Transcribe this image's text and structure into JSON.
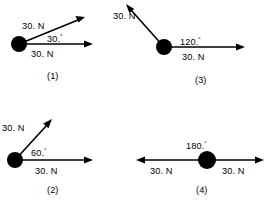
{
  "figure": {
    "background_color": "#ffffff",
    "ink_color": "#000000",
    "degree_symbol": "°",
    "panels": [
      {
        "id": "panel-1",
        "caption": "(1)",
        "angle_label": "30.",
        "angle_value": 30,
        "force_a_label": "30. N",
        "force_b_label": "30. N",
        "vectors": [
          {
            "name": "horizontal-force",
            "magnitude": "30. N",
            "direction_deg": 0
          },
          {
            "name": "angled-force",
            "magnitude": "30. N",
            "direction_deg": 30
          }
        ]
      },
      {
        "id": "panel-3",
        "caption": "(3)",
        "angle_label": "120.",
        "angle_value": 120,
        "force_a_label": "30. N",
        "force_b_label": "30. N",
        "vectors": [
          {
            "name": "horizontal-force",
            "magnitude": "30. N",
            "direction_deg": 0
          },
          {
            "name": "angled-force",
            "magnitude": "30. N",
            "direction_deg": 120
          }
        ]
      },
      {
        "id": "panel-2",
        "caption": "(2)",
        "angle_label": "60.",
        "angle_value": 60,
        "force_a_label": "30. N",
        "force_b_label": "30. N",
        "vectors": [
          {
            "name": "horizontal-force",
            "magnitude": "30. N",
            "direction_deg": 0
          },
          {
            "name": "angled-force",
            "magnitude": "30. N",
            "direction_deg": 60
          }
        ]
      },
      {
        "id": "panel-4",
        "caption": "(4)",
        "angle_label": "180.",
        "angle_value": 180,
        "force_a_label": "30. N",
        "force_b_label": "30. N",
        "vectors": [
          {
            "name": "right-force",
            "magnitude": "30. N",
            "direction_deg": 0
          },
          {
            "name": "left-force",
            "magnitude": "30. N",
            "direction_deg": 180
          }
        ]
      }
    ]
  }
}
